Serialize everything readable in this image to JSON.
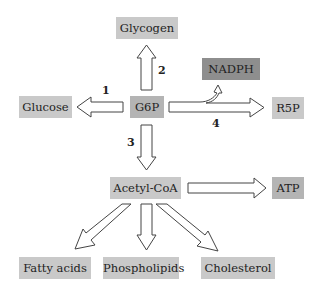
{
  "diagram": {
    "nodes": {
      "glycogen": "Glycogen",
      "glucose": "Glucose",
      "g6p": "G6P",
      "nadph": "NADPH",
      "r5p": "R5P",
      "acetyl_coa": "Acetyl-CoA",
      "atp": "ATP",
      "fatty_acids": "Fatty acids",
      "phospholipids": "Phospholipids",
      "cholesterol": "Cholesterol"
    },
    "pathway_labels": {
      "p1": "1",
      "p2": "2",
      "p3": "3",
      "p4": "4"
    },
    "edges": [
      {
        "from": "G6P",
        "to": "Glucose",
        "label": "1"
      },
      {
        "from": "G6P",
        "to": "Glycogen",
        "label": "2"
      },
      {
        "from": "G6P",
        "to": "Acetyl-CoA",
        "label": "3"
      },
      {
        "from": "G6P",
        "to": "R5P",
        "label": "4",
        "branch": "NADPH"
      },
      {
        "from": "Acetyl-CoA",
        "to": "ATP"
      },
      {
        "from": "Acetyl-CoA",
        "to": "Fatty acids"
      },
      {
        "from": "Acetyl-CoA",
        "to": "Phospholipids"
      },
      {
        "from": "Acetyl-CoA",
        "to": "Cholesterol"
      }
    ],
    "colors": {
      "box_light": "#c9c9c9",
      "box_mid": "#b4b4b4",
      "box_dark": "#8e8e8e",
      "arrow_stroke": "#444444"
    }
  }
}
